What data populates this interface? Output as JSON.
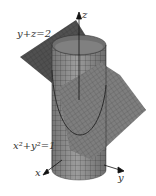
{
  "figure": {
    "labels": {
      "plane_equation": "y+z=2",
      "cylinder_equation": "x²+y²=1",
      "axis_x": "x",
      "axis_y": "y",
      "axis_z": "z"
    },
    "colors": {
      "background": "#ffffff",
      "plane_dark": "#4a4a4a",
      "plane_light": "#8a8a8a",
      "cylinder": "#9a9a9a",
      "cylinder_shade": "#7a7a7a",
      "grid": "#3a3a3a",
      "axis": "#111111",
      "text": "#333333"
    }
  }
}
